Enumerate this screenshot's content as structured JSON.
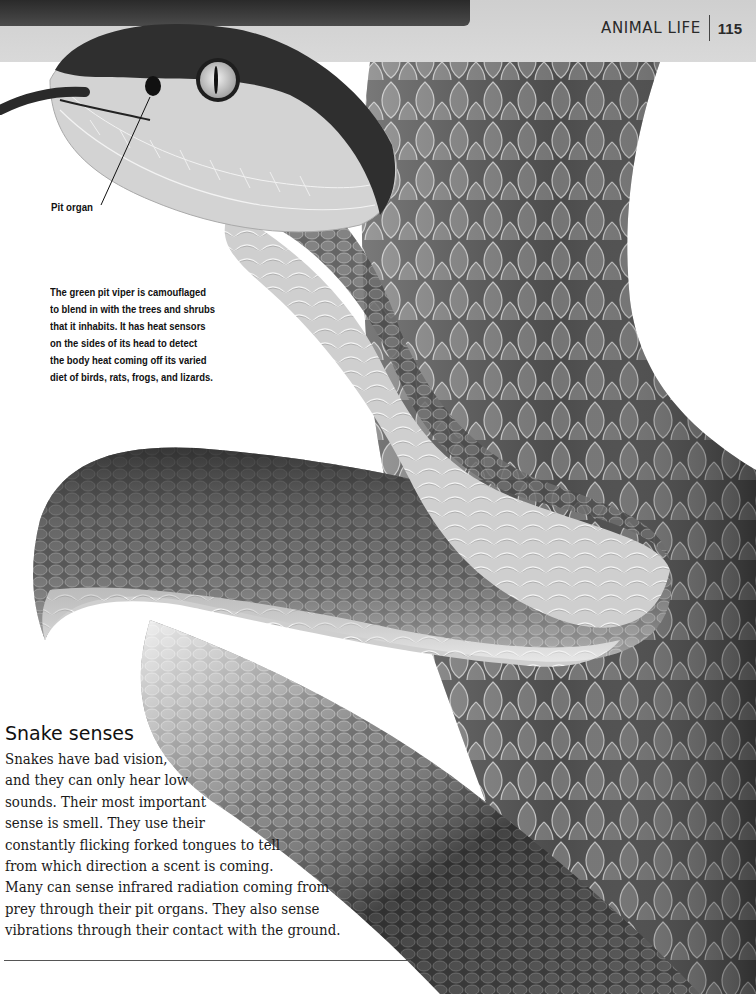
{
  "header": {
    "section_label": "ANIMAL LIFE",
    "page_number": "115"
  },
  "photo": {
    "subject": "green pit viper (grayscale)",
    "annotation_label": "Pit organ"
  },
  "caption": {
    "lines": [
      "The green pit viper is camouflaged",
      "to blend in with the trees and shrubs",
      "that it inhabits. It has heat sensors",
      "on the sides of its head to detect",
      "the body heat coming off its varied",
      "diet of birds, rats, frogs, and lizards."
    ]
  },
  "section": {
    "title": "Snake senses",
    "lines": [
      "Snakes have bad vision,",
      "and they can only hear low",
      "sounds. Their most important",
      "sense is smell. They use their",
      "constantly flicking forked tongues to tell",
      "from which direction a scent is coming.",
      "Many can sense infrared radiation coming from",
      "prey through their pit organs. They also sense",
      "vibrations through their contact with the ground."
    ]
  }
}
